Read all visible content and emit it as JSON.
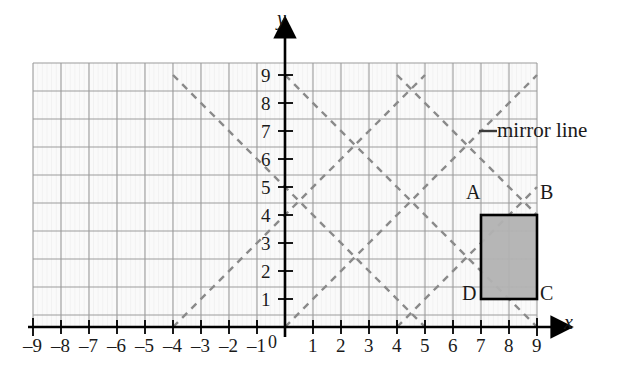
{
  "figure": {
    "type": "coordinate-grid-diagram",
    "title": "",
    "axis_labels": {
      "x": "x",
      "y": "y",
      "origin": "0"
    },
    "x_axis": {
      "min": -9,
      "max": 9,
      "ticks": [
        "–9",
        "–8",
        "–7",
        "–6",
        "–5",
        "–4",
        "–3",
        "–2",
        "–1",
        "1",
        "2",
        "3",
        "4",
        "5",
        "6",
        "7",
        "8",
        "9"
      ],
      "tick_values": [
        -9,
        -8,
        -7,
        -6,
        -5,
        -4,
        -3,
        -2,
        -1,
        1,
        2,
        3,
        4,
        5,
        6,
        7,
        8,
        9
      ]
    },
    "y_axis": {
      "min": 0,
      "max": 9,
      "ticks": [
        "1",
        "2",
        "3",
        "4",
        "5",
        "6",
        "7",
        "8",
        "9"
      ],
      "tick_values": [
        1,
        2,
        3,
        4,
        5,
        6,
        7,
        8,
        9
      ]
    },
    "grid": {
      "visible": true,
      "x_from": -9,
      "x_to": 9,
      "y_from": 0,
      "y_to": 9,
      "color": "#9c9c9c",
      "minor_color": "#e2e2e2"
    },
    "shape": {
      "name": "rectangle-ABCD",
      "fill": "#b2b2b2",
      "stroke": "#000000",
      "x_from": 7,
      "x_to": 9,
      "y_from": 1,
      "y_to": 4,
      "vertices": [
        {
          "label": "A",
          "x": 7,
          "y": 4
        },
        {
          "label": "B",
          "x": 9,
          "y": 4
        },
        {
          "label": "C",
          "x": 9,
          "y": 1
        },
        {
          "label": "D",
          "x": 7,
          "y": 1
        }
      ]
    },
    "mirror_lines": {
      "label": "mirror line",
      "label_dash": "–",
      "color": "#8a8a8a",
      "dash_pattern": "7 6",
      "lines": [
        {
          "slope": 1,
          "intercept": 0,
          "note": "y = x"
        },
        {
          "slope": 1,
          "intercept": 4,
          "note": "y = x + 4"
        },
        {
          "slope": 1,
          "intercept": -4,
          "note": "y = x - 4"
        },
        {
          "slope": -1,
          "intercept": 9,
          "note": "y = -x + 9"
        },
        {
          "slope": -1,
          "intercept": 13,
          "note": "y = -x + 13"
        },
        {
          "slope": -1,
          "intercept": 5,
          "note": "y = -x + 5"
        }
      ]
    },
    "colors": {
      "axis": "#000000",
      "grid_major": "#9c9c9c",
      "grid_minor": "#e4e4e4",
      "shape_fill": "#b2b2b2",
      "dash": "#8a8a8a",
      "background": "#ffffff"
    }
  }
}
